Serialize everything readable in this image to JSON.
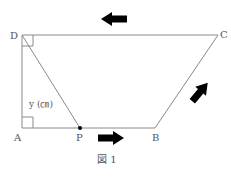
{
  "figure": {
    "caption": "図 1",
    "points": {
      "A": {
        "label": "A",
        "x": 22,
        "y": 128
      },
      "B": {
        "label": "B",
        "x": 155,
        "y": 128
      },
      "C": {
        "label": "C",
        "x": 218,
        "y": 35
      },
      "D": {
        "label": "D",
        "x": 22,
        "y": 35
      },
      "P": {
        "label": "P",
        "x": 80,
        "y": 128
      }
    },
    "segment_label": "y (㎝)",
    "arrows": [
      {
        "direction": "left",
        "position": "above DC"
      },
      {
        "direction": "right",
        "position": "below AB"
      },
      {
        "direction": "up-right",
        "position": "beside BC"
      }
    ],
    "colors": {
      "line": "#8a8a8a",
      "arrow": "#000000",
      "text": "#555555"
    }
  }
}
